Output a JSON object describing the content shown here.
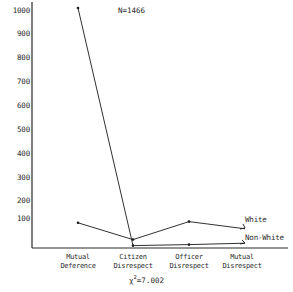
{
  "annotations": {
    "sample_size": "N=1466",
    "chi_square_symbol": "χ",
    "chi_square_exponent": "2",
    "chi_square_value": "=7.002"
  },
  "legend": {
    "white_label": "White",
    "nonwhite_label": "Non-White"
  },
  "axis": {
    "yticks": [
      "1000",
      "900",
      "800",
      "700",
      "600",
      "500",
      "400",
      "300",
      "200",
      "100"
    ],
    "xticks": [
      {
        "line1": "Mutual",
        "line2": "Deference"
      },
      {
        "line1": "Citizen",
        "line2": "Disrespect"
      },
      {
        "line1": "Officer",
        "line2": "Disrespect"
      },
      {
        "line1": "Mutual",
        "line2": "Disrespect"
      }
    ]
  },
  "chart_data": {
    "type": "line",
    "title": "",
    "subtitle": "",
    "xlabel": "",
    "ylabel": "",
    "categories": [
      "Mutual Deference",
      "Citizen Disrespect",
      "Officer Disrespect",
      "Mutual Disrespect"
    ],
    "series": [
      {
        "name": "White",
        "values": [
          105,
          35,
          110,
          80
        ],
        "color": "#1a1a1a"
      },
      {
        "name": "Non-White",
        "values": [
          1000,
          10,
          14,
          20
        ],
        "color": "#1a1a1a"
      }
    ],
    "ylim": [
      0,
      1000
    ],
    "yticks": [
      100,
      200,
      300,
      400,
      500,
      600,
      700,
      800,
      900,
      1000
    ],
    "grid": false,
    "legend_position": "right-inline",
    "annotations": [
      "N=1466",
      "χ²=7.002"
    ]
  },
  "colors": {
    "ink": "#1a1a1a",
    "background": "#ffffff"
  }
}
